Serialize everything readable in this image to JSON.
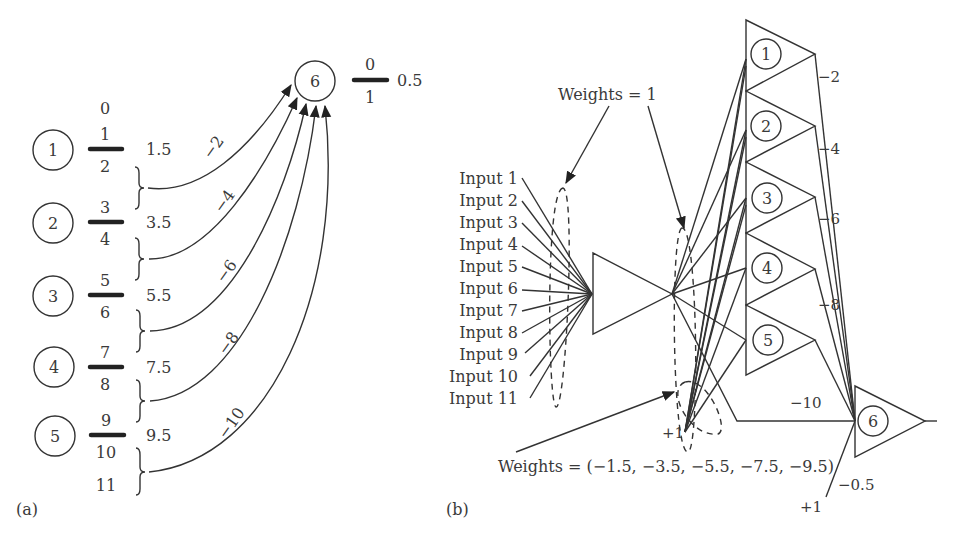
{
  "panel_a": {
    "label": "(a)",
    "neurons": [
      {
        "id": "1",
        "upper": "1",
        "lower": "2",
        "threshold": "1.5",
        "weight": "−2"
      },
      {
        "id": "2",
        "upper": "3",
        "lower": "4",
        "threshold": "3.5",
        "weight": "−4"
      },
      {
        "id": "3",
        "upper": "5",
        "lower": "6",
        "threshold": "5.5",
        "weight": "−6"
      },
      {
        "id": "4",
        "upper": "7",
        "lower": "8",
        "threshold": "7.5",
        "weight": "−8"
      },
      {
        "id": "5",
        "upper": "9",
        "lower": "10",
        "threshold": "9.5",
        "weight": "−10"
      }
    ],
    "top_value": "0",
    "bottom_value": "11",
    "output_neuron": {
      "id": "6",
      "upper": "0",
      "lower": "1",
      "threshold": "0.5"
    }
  },
  "panel_b": {
    "label": "(b)",
    "inputs": [
      "Input 1",
      "Input 2",
      "Input 3",
      "Input 4",
      "Input 5",
      "Input 6",
      "Input 7",
      "Input 8",
      "Input 9",
      "Input 10",
      "Input 11"
    ],
    "weights_top_label": "Weights = 1",
    "weights_bottom_label": "Weights = (−1.5, −3.5, −5.5, −7.5, −9.5)",
    "bias_label": "+1",
    "hidden_neurons": [
      {
        "id": "1",
        "weight": "−2"
      },
      {
        "id": "2",
        "weight": "−4"
      },
      {
        "id": "3",
        "weight": "−6"
      },
      {
        "id": "4",
        "weight": "−8"
      },
      {
        "id": "5",
        "weight": "−10"
      }
    ],
    "output_neuron": {
      "id": "6",
      "bias_weight": "−0.5",
      "bias_label": "+1"
    }
  }
}
